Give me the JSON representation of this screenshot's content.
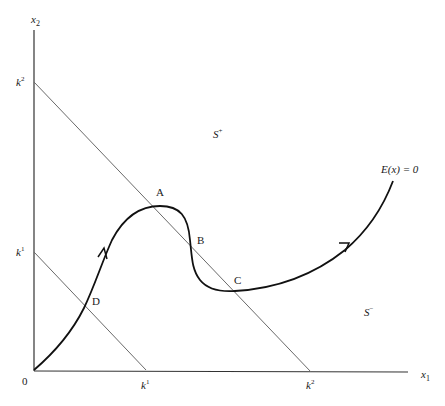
{
  "diagram": {
    "axes": {
      "x_label": "x",
      "x_sub": "1",
      "y_label": "x",
      "y_sub": "2",
      "origin_label": "0"
    },
    "boundary_lines": [
      {
        "name": "k1-line",
        "y_intercept_label": "k",
        "y_intercept_sup": "1",
        "x_intercept_label": "k",
        "x_intercept_sup": "1"
      },
      {
        "name": "k2-line",
        "y_intercept_label": "k",
        "y_intercept_sup": "2",
        "x_intercept_label": "k",
        "x_intercept_sup": "2"
      }
    ],
    "regions": {
      "upper": {
        "label": "S",
        "sup": "+"
      },
      "lower": {
        "label": "S",
        "sup": "−"
      }
    },
    "curve": {
      "label": "E(x) = 0",
      "points": {
        "A": "A",
        "B": "B",
        "C": "C",
        "D": "D"
      }
    },
    "colors": {
      "axis": "#333333",
      "boundary": "#6a6a6a",
      "curve": "#111111",
      "background": "#ffffff"
    }
  }
}
